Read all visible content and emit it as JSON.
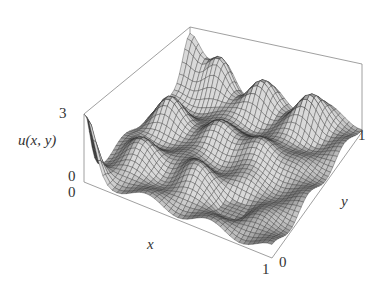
{
  "chart_data": {
    "type": "surface3d",
    "title": "",
    "zlabel": "u(x, y)",
    "xlabel": "x",
    "ylabel": "y",
    "x_range": [
      0,
      1
    ],
    "y_range": [
      0,
      1
    ],
    "z_range": [
      0,
      3
    ],
    "x_ticks": [
      "0",
      "1"
    ],
    "y_ticks": [
      "0",
      "1"
    ],
    "z_ticks": [
      "0",
      "3"
    ],
    "grid": false,
    "box": true,
    "mesh_color": "#2a2a2a",
    "surface_color": "#9a9a9a"
  },
  "labels": {
    "z_top": "3",
    "z_bottom": "0",
    "x_start": "0",
    "x_end": "1",
    "y_start": "0",
    "y_end": "1",
    "zlabel_func": "u",
    "zlabel_args": "(x, y)",
    "xlabel": "x",
    "ylabel": "y"
  }
}
